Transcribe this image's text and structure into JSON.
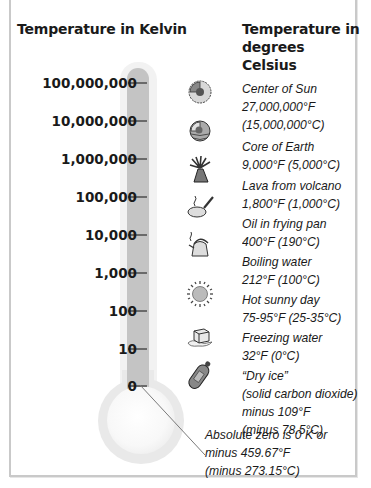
{
  "headers": {
    "kelvin": "Temperature in Kelvin",
    "celsius_line1": "Temperature in",
    "celsius_line2": "degrees Celsius"
  },
  "kelvin_scale": [
    {
      "label": "100,000,000",
      "y": 82
    },
    {
      "label": "10,000,000",
      "y": 120
    },
    {
      "label": "1,000,000",
      "y": 158
    },
    {
      "label": "100,000",
      "y": 196
    },
    {
      "label": "10,000",
      "y": 234
    },
    {
      "label": "1,000",
      "y": 272
    },
    {
      "label": "100",
      "y": 310
    },
    {
      "label": "10",
      "y": 348
    },
    {
      "label": "0",
      "y": 385
    }
  ],
  "items": [
    {
      "icon": "sun-core-icon",
      "lines": [
        "Center of Sun",
        "27,000,000°F",
        "(15,000,000°C)"
      ]
    },
    {
      "icon": "earth-core-icon",
      "lines": [
        "Core of Earth",
        "9,000°F (5,000°C)"
      ]
    },
    {
      "icon": "volcano-icon",
      "lines": [
        "Lava from volcano",
        "1,800°F (1,000°C)"
      ]
    },
    {
      "icon": "frying-pan-icon",
      "lines": [
        "Oil in frying pan",
        "400°F (190°C)"
      ]
    },
    {
      "icon": "kettle-icon",
      "lines": [
        "Boiling water",
        "212°F (100°C)"
      ]
    },
    {
      "icon": "sun-icon",
      "lines": [
        "Hot sunny day",
        "75-95°F (25-35°C)"
      ]
    },
    {
      "icon": "ice-cube-icon",
      "lines": [
        "Freezing water",
        "32°F (0°C)"
      ]
    },
    {
      "icon": "dry-ice-canister-icon",
      "lines": [
        "“Dry ice”",
        "(solid carbon dioxide)",
        "minus 109°F",
        "(minus 78.5°C)"
      ]
    }
  ],
  "absolute_zero": {
    "lines": [
      "Absolute zero is 0 K or",
      "minus 459.67°F",
      "(minus 273.15°C)"
    ]
  },
  "colors": {
    "tube": "#c4c4c4",
    "tick": "#6a6a6a",
    "frame": "#c9c9c9",
    "text": "#1a1a1a"
  }
}
